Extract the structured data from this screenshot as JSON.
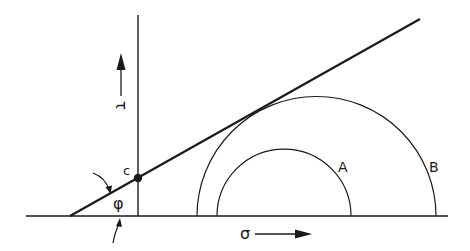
{
  "diagram": {
    "labels": {
      "cohesion": "c",
      "friction_angle": "φ",
      "shear_stress": "τ",
      "normal_stress": "σ",
      "circle_a": "A",
      "circle_b": "B"
    },
    "colors": {
      "stroke": "#1a1a1a",
      "background": "#ffffff"
    },
    "geometry": {
      "baseline": {
        "x1": 26,
        "x2": 448,
        "y": 216
      },
      "tau_axis": {
        "x": 138,
        "y1": 15,
        "y2": 216
      },
      "envelope": {
        "x1": 70,
        "y1": 216,
        "x2": 420,
        "y2": 19
      },
      "cohesion_point": {
        "x": 138,
        "y": 178
      },
      "circle_a": {
        "cx": 284,
        "cy": 216,
        "r": 67
      },
      "circle_b": {
        "cx": 316.5,
        "cy": 216,
        "r": 119.5
      }
    }
  }
}
